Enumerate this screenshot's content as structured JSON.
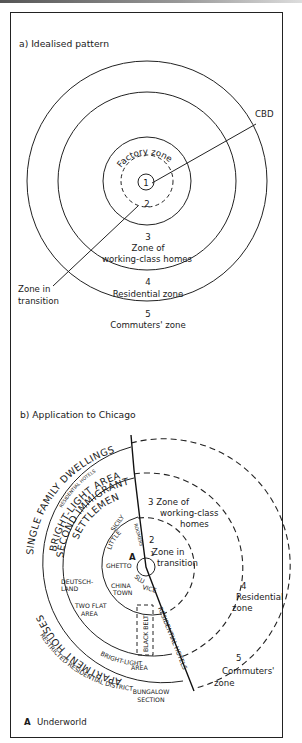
{
  "panel_a": {
    "title": "a) Idealised pattern",
    "zones": [
      {
        "number": "1",
        "label": ""
      },
      {
        "number": "2",
        "label": "Factory zone"
      },
      {
        "number": "3",
        "label_line1": "Zone of",
        "label_line2": "working-class homes"
      },
      {
        "number": "4",
        "label": "Residential zone"
      },
      {
        "number": "5",
        "label": "Commuters' zone"
      }
    ],
    "callouts": {
      "cbd": "CBD",
      "transition_line1": "Zone in",
      "transition_line2": "transition"
    }
  },
  "panel_b": {
    "title": "b) Application to Chicago",
    "zones": {
      "z1": "1",
      "z2_num": "2",
      "z2_line1": "Zone in",
      "z2_line2": "transition",
      "z3_line1": "3  Zone of",
      "z3_line2": "working-class",
      "z3_line3": "homes",
      "z4_num": "4",
      "z4_line1": "Residential",
      "z4_line2": "zone",
      "z5_num": "5",
      "z5_line1": "Commuters'",
      "z5_line2": "zone"
    },
    "areas": {
      "single_family": "SINGLE FAMILY DWELLINGS",
      "residential_hotels_top": "RESIDENTIAL HOTELS",
      "bright_light_top": "BRIGHT-LIGHT AREA",
      "second_immigrant": "SECOND IMMIGRANT",
      "settlement": "SETTLEMENT",
      "apartment_houses": "APARTMENT HOUSES",
      "restricted": "RESTRICTED RESIDENTIAL DISTRICT",
      "bungalow_line1": "BUNGALOW",
      "bungalow_line2": "SECTION",
      "bright_light_bottom_line1": "BRIGHT-LIGHT",
      "bright_light_bottom_line2": "AREA",
      "residential_hotels_side": "RESIDENTIAL HOTELS",
      "black_belt": "BLACK BELT",
      "deutschland_line1": "DEUTSCH-",
      "deutschland_line2": "LAND",
      "two_flat_line1": "TWO FLAT",
      "two_flat_line2": "AREA",
      "little_sicily_line1": "LITTLE",
      "little_sicily_line2": "SICILY",
      "roomers": "ROOMERS",
      "ghetto": "GHETTO",
      "slum": "SLUM",
      "china_line1": "CHINA",
      "china_line2": "TOWN",
      "vice": "VICE",
      "underworld_marker": "A"
    }
  },
  "legend": {
    "key": "A",
    "text": "Underworld"
  }
}
